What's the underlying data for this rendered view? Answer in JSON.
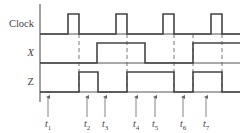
{
  "diagram": {
    "type": "timing-diagram",
    "signals": [
      {
        "name": "Clock",
        "italic": false,
        "baseline_y": 34,
        "high_y": 14,
        "high_intervals": [
          [
            68,
            79
          ],
          [
            116,
            127
          ],
          [
            163,
            174
          ],
          [
            211,
            222
          ]
        ]
      },
      {
        "name": "X",
        "italic": true,
        "baseline_y": 63,
        "high_y": 43,
        "high_intervals": [
          [
            97,
            145
          ],
          [
            193,
            240
          ]
        ]
      },
      {
        "name": "Z",
        "italic": false,
        "baseline_y": 92,
        "high_y": 72,
        "high_intervals": [
          [
            79,
            98
          ],
          [
            127,
            174
          ],
          [
            193,
            222
          ]
        ]
      }
    ],
    "dashed_lines_x": [
      79,
      127,
      174,
      193,
      222
    ],
    "time_markers": [
      {
        "label": "t",
        "sub": "1",
        "x": 48
      },
      {
        "label": "t",
        "sub": "2",
        "x": 87
      },
      {
        "label": "t",
        "sub": "3",
        "x": 105
      },
      {
        "label": "t",
        "sub": "4",
        "x": 136
      },
      {
        "label": "t",
        "sub": "5",
        "x": 155
      },
      {
        "label": "t",
        "sub": "6",
        "x": 183
      },
      {
        "label": "t",
        "sub": "7",
        "x": 206
      }
    ],
    "x_start": 40,
    "x_end": 240,
    "colors": {
      "trace": "#444444",
      "text": "#444444"
    }
  }
}
